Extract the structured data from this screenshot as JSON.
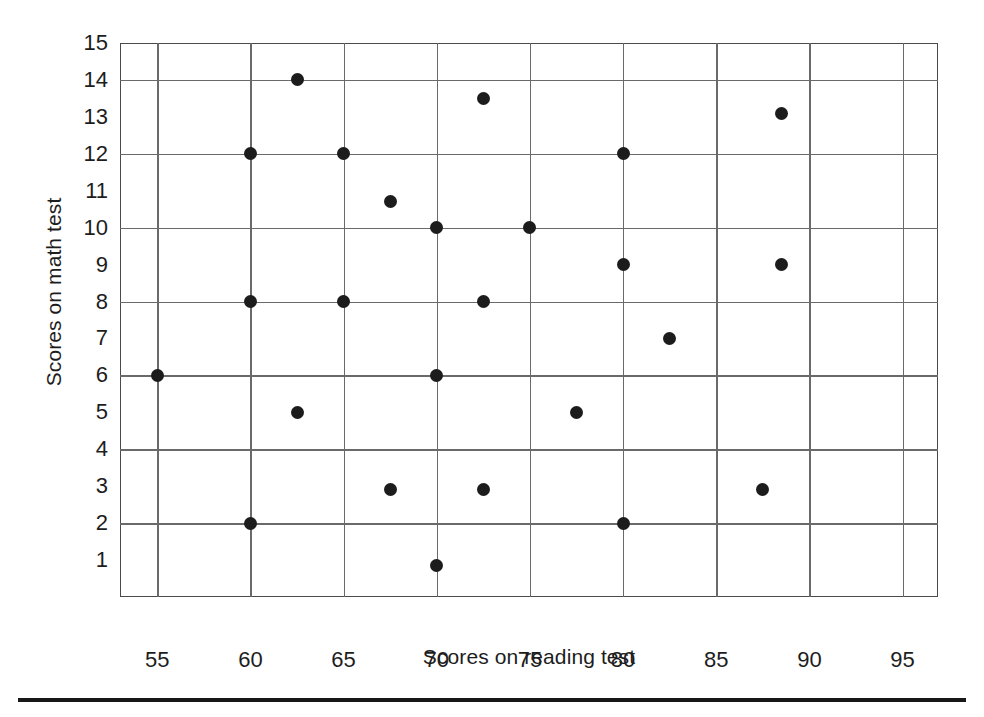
{
  "chart_data": {
    "type": "scatter",
    "title": "",
    "xlabel": "Scores on reading test",
    "ylabel": "Scores on math test",
    "xlim": [
      53,
      96.9
    ],
    "ylim": [
      0,
      15
    ],
    "xticks": [
      55,
      60,
      65,
      70,
      75,
      80,
      85,
      90,
      95
    ],
    "xtick_labels": [
      "55",
      "60",
      "65",
      "70",
      "75",
      "80",
      "85",
      "90",
      "95"
    ],
    "yticks": [
      1,
      2,
      3,
      4,
      5,
      6,
      7,
      8,
      9,
      10,
      11,
      12,
      13,
      14,
      15
    ],
    "ytick_labels": [
      "1",
      "2",
      "3",
      "4",
      "5",
      "6",
      "7",
      "8",
      "9",
      "10",
      "11",
      "12",
      "13",
      "14",
      "15"
    ],
    "x_gridlines": [
      55,
      60,
      65,
      70,
      75,
      80,
      85,
      90,
      95
    ],
    "y_gridlines": [
      2,
      4,
      6,
      8,
      10,
      12,
      14
    ],
    "grid": true,
    "legend": false,
    "marker": "filled-circle",
    "marker_color": "#1c1c1c",
    "marker_size": 13,
    "points": [
      {
        "x": 55,
        "y": 6
      },
      {
        "x": 60,
        "y": 12
      },
      {
        "x": 60,
        "y": 8
      },
      {
        "x": 60,
        "y": 2
      },
      {
        "x": 62.5,
        "y": 14
      },
      {
        "x": 62.5,
        "y": 5
      },
      {
        "x": 65,
        "y": 12
      },
      {
        "x": 65,
        "y": 8
      },
      {
        "x": 67.5,
        "y": 10.7
      },
      {
        "x": 67.5,
        "y": 2.9
      },
      {
        "x": 70,
        "y": 10
      },
      {
        "x": 70,
        "y": 6
      },
      {
        "x": 70,
        "y": 0.85
      },
      {
        "x": 72.5,
        "y": 13.5
      },
      {
        "x": 72.5,
        "y": 8
      },
      {
        "x": 72.5,
        "y": 2.9
      },
      {
        "x": 75,
        "y": 10
      },
      {
        "x": 77.5,
        "y": 5
      },
      {
        "x": 80,
        "y": 12
      },
      {
        "x": 80,
        "y": 9
      },
      {
        "x": 80,
        "y": 2
      },
      {
        "x": 82.5,
        "y": 7
      },
      {
        "x": 87.5,
        "y": 2.9
      },
      {
        "x": 88.5,
        "y": 13.1
      },
      {
        "x": 88.5,
        "y": 9
      }
    ]
  }
}
